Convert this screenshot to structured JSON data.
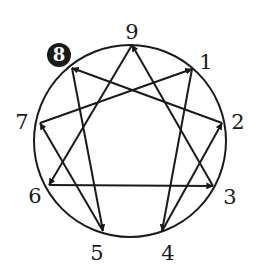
{
  "diagram": {
    "circle": {
      "cx": 130,
      "cy": 141,
      "r": 96
    },
    "stroke_color": "#1a1a1a",
    "highlight_color": "#1a1a1a",
    "highlighted_point": "8",
    "points": [
      {
        "id": "9",
        "label": "9",
        "x": 132,
        "y": 45,
        "lx": 132,
        "ly": 32
      },
      {
        "id": "1",
        "label": "1",
        "x": 192,
        "y": 69,
        "lx": 206,
        "ly": 62
      },
      {
        "id": "2",
        "label": "2",
        "x": 222,
        "y": 123,
        "lx": 238,
        "ly": 122
      },
      {
        "id": "3",
        "label": "3",
        "x": 213,
        "y": 186,
        "lx": 230,
        "ly": 197
      },
      {
        "id": "4",
        "label": "4",
        "x": 162,
        "y": 231,
        "lx": 168,
        "ly": 253
      },
      {
        "id": "5",
        "label": "5",
        "x": 103,
        "y": 231,
        "lx": 97,
        "ly": 253
      },
      {
        "id": "6",
        "label": "6",
        "x": 49,
        "y": 185,
        "lx": 35,
        "ly": 196
      },
      {
        "id": "7",
        "label": "7",
        "x": 40,
        "y": 123,
        "lx": 22,
        "ly": 122
      },
      {
        "id": "8",
        "label": "8",
        "x": 72,
        "y": 68,
        "lx": 59,
        "ly": 55
      }
    ],
    "arrows": [
      {
        "from": "2",
        "to": "8"
      },
      {
        "from": "7",
        "to": "1"
      },
      {
        "from": "4",
        "to": "2"
      },
      {
        "from": "6",
        "to": "3"
      },
      {
        "from": "1",
        "to": "4"
      },
      {
        "from": "8",
        "to": "5"
      },
      {
        "from": "9",
        "to": "6"
      },
      {
        "from": "5",
        "to": "7"
      },
      {
        "from": "3",
        "to": "9"
      }
    ]
  }
}
